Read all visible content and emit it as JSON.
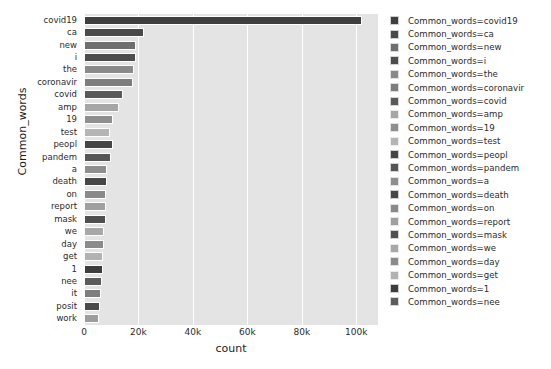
{
  "chart_data": {
    "type": "bar",
    "orientation": "horizontal",
    "title": "",
    "xlabel": "count",
    "ylabel": "Common_words",
    "xlim": [
      0,
      108000
    ],
    "ylim": [
      0,
      24
    ],
    "grid": true,
    "gridlines_axis": "x",
    "legend_position": "right",
    "legend_title": "",
    "xticks": [
      0,
      20000,
      40000,
      60000,
      80000,
      100000
    ],
    "xticklabels": [
      "0",
      "20k",
      "40k",
      "60k",
      "80k",
      "100k"
    ],
    "categories": [
      "covid19",
      "ca",
      "new",
      "i",
      "the",
      "coronavir",
      "covid",
      "amp",
      "19",
      "test",
      "peopl",
      "pandem",
      "a",
      "death",
      "on",
      "report",
      "mask",
      "we",
      "day",
      "get",
      "1",
      "nee",
      "it",
      "posit",
      "work"
    ],
    "values": [
      102000,
      22000,
      19000,
      19000,
      18500,
      18000,
      14500,
      13000,
      10500,
      9500,
      10500,
      10000,
      8500,
      8300,
      8000,
      8000,
      8000,
      7500,
      7500,
      7000,
      7000,
      6500,
      6200,
      6000,
      5500
    ],
    "bar_colors": [
      "#3f3f3f",
      "#4a4a4a",
      "#6f6f6f",
      "#4d4d4d",
      "#8a8a8a",
      "#7d7d7d",
      "#5a5a5a",
      "#a6a6a6",
      "#8f8f8f",
      "#b5b5b5",
      "#464646",
      "#565656",
      "#8e8e8e",
      "#474747",
      "#8a8a8a",
      "#a0a0a0",
      "#4f4f4f",
      "#a8a8a8",
      "#8b8b8b",
      "#b2b2b2",
      "#3d3d3d",
      "#5c5c5c",
      "#7e7e7e",
      "#4b4b4b",
      "#9d9d9d"
    ],
    "legend_entries": [
      {
        "label": "Common_words=covid19",
        "color": "#3f3f3f"
      },
      {
        "label": "Common_words=ca",
        "color": "#4a4a4a"
      },
      {
        "label": "Common_words=new",
        "color": "#6f6f6f"
      },
      {
        "label": "Common_words=i",
        "color": "#4d4d4d"
      },
      {
        "label": "Common_words=the",
        "color": "#8a8a8a"
      },
      {
        "label": "Common_words=coronavir",
        "color": "#7d7d7d"
      },
      {
        "label": "Common_words=covid",
        "color": "#5a5a5a"
      },
      {
        "label": "Common_words=amp",
        "color": "#a6a6a6"
      },
      {
        "label": "Common_words=19",
        "color": "#8f8f8f"
      },
      {
        "label": "Common_words=test",
        "color": "#b5b5b5"
      },
      {
        "label": "Common_words=peopl",
        "color": "#464646"
      },
      {
        "label": "Common_words=pandem",
        "color": "#565656"
      },
      {
        "label": "Common_words=a",
        "color": "#8e8e8e"
      },
      {
        "label": "Common_words=death",
        "color": "#474747"
      },
      {
        "label": "Common_words=on",
        "color": "#8a8a8a"
      },
      {
        "label": "Common_words=report",
        "color": "#a0a0a0"
      },
      {
        "label": "Common_words=mask",
        "color": "#4f4f4f"
      },
      {
        "label": "Common_words=we",
        "color": "#a8a8a8"
      },
      {
        "label": "Common_words=day",
        "color": "#8b8b8b"
      },
      {
        "label": "Common_words=get",
        "color": "#b2b2b2"
      },
      {
        "label": "Common_words=1",
        "color": "#3d3d3d"
      },
      {
        "label": "Common_words=nee",
        "color": "#5c5c5c"
      }
    ],
    "plot_background": "#e4e4e4",
    "gridline_color": "#ffffff",
    "figure_background": "#ffffff"
  }
}
